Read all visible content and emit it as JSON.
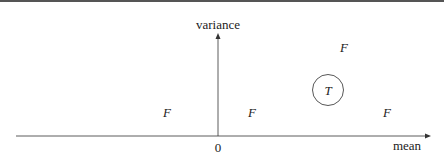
{
  "diagram": {
    "top_rule_color": "#555555",
    "axes": {
      "x_label": "mean",
      "y_label": "variance",
      "origin_label": "0"
    },
    "points": [
      {
        "label": "F",
        "x": 167,
        "y": 112
      },
      {
        "label": "F",
        "x": 252,
        "y": 112
      },
      {
        "label": "F",
        "x": 344,
        "y": 47
      },
      {
        "label": "T",
        "x": 328,
        "y": 90,
        "circled": true
      },
      {
        "label": "F",
        "x": 387,
        "y": 112
      }
    ]
  }
}
